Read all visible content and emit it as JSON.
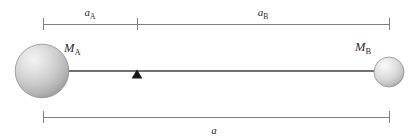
{
  "figure": {
    "kind": "two-body-barycenter-diagram",
    "background_color": "#ffffff",
    "width": 416,
    "height": 140
  },
  "labels": {
    "a_sub_A": {
      "base": "a",
      "sub": "A"
    },
    "a_sub_B": {
      "base": "a",
      "sub": "B"
    },
    "a_total": {
      "base": "a",
      "sub": ""
    },
    "M_sub_A": {
      "base": "M",
      "sub": "A"
    },
    "M_sub_B": {
      "base": "M",
      "sub": "B"
    }
  },
  "bodies": [
    {
      "name": "mass-a",
      "label_base": "M",
      "label_sub": "A",
      "cx": 42,
      "cy": 71,
      "r": 27,
      "fill_light": "#eeeeee",
      "fill_mid": "#c9c9c9",
      "fill_dark": "#9a9a9a",
      "stroke": "#8a8a8a"
    },
    {
      "name": "mass-b",
      "label_base": "M",
      "label_sub": "B",
      "cx": 389,
      "cy": 72,
      "r": 15,
      "fill_light": "#f2f2f2",
      "fill_mid": "#d6d6d6",
      "fill_dark": "#a8a8a8",
      "stroke": "#8a8a8a"
    }
  ],
  "dimensions": {
    "top_bar": {
      "y": 24,
      "x_start": 43,
      "x_split": 137,
      "x_end": 389,
      "stroke": "#808080",
      "segments": [
        {
          "name": "a-sub-A",
          "label_base": "a",
          "label_sub": "A",
          "label_x": 90,
          "label_y": 16
        },
        {
          "name": "a-sub-B",
          "label_base": "a",
          "label_sub": "B",
          "label_x": 263,
          "label_y": 16
        }
      ]
    },
    "bottom_bar": {
      "y": 117,
      "x_start": 43,
      "x_end": 389,
      "stroke": "#808080",
      "label_base": "a",
      "label_sub": "",
      "label_x": 214,
      "label_y": 134
    }
  },
  "rod": {
    "name": "connecting-rod",
    "y": 71,
    "x_start": 68,
    "x_end": 375,
    "stroke": "#707070"
  },
  "fulcrum": {
    "name": "barycenter-marker",
    "apex_x": 137,
    "apex_y": 70,
    "half_width": 5.5,
    "base_y": 78,
    "fill": "#1a1a1a"
  }
}
